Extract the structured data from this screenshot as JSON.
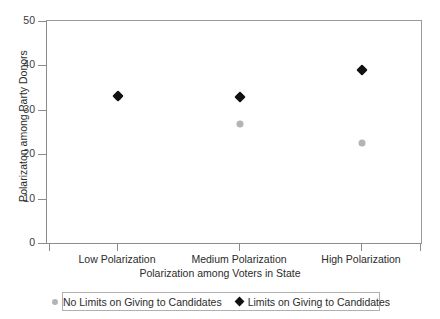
{
  "chart_data": {
    "type": "scatter",
    "title": "",
    "xlabel": "Polarization among Voters in State",
    "ylabel": "Polarizaton among Party Donors",
    "categories": [
      "Low Polarization",
      "Medium Polarization",
      "High Polarization"
    ],
    "ylim": [
      0,
      50
    ],
    "yticks": [
      0,
      10,
      20,
      30,
      40,
      50
    ],
    "ytick_labels": [
      "0",
      "10",
      "20",
      "30",
      "40",
      "50"
    ],
    "grid": false,
    "legend_position": "bottom",
    "series": [
      {
        "name": "No Limits on Giving to Candidates",
        "marker": "circle",
        "color": "#b4b4b4",
        "values": [
          33.2,
          27.0,
          22.7
        ]
      },
      {
        "name": "Limits on Giving to Candidates",
        "marker": "diamond",
        "color": "#111111",
        "values": [
          33.4,
          33.2,
          39.2
        ]
      }
    ]
  },
  "axis": {
    "y_title": "Polarizaton among Party Donors",
    "x_title": "Polarization among Voters in State",
    "y_tick_labels": [
      "50",
      "40",
      "30",
      "20",
      "10",
      "0"
    ],
    "x_tick_labels": [
      "Low Polarization",
      "Medium Polarization",
      "High Polarization"
    ]
  },
  "legend": {
    "entries": [
      {
        "label": "No Limits on Giving to Candidates",
        "marker": "circle",
        "color": "#b4b4b4"
      },
      {
        "label": "Limits on Giving to Candidates",
        "marker": "diamond",
        "color": "#111111"
      }
    ]
  },
  "colors": {
    "no_limits": "#b4b4b4",
    "limits": "#111111",
    "axis": "#8c8c8c",
    "text": "#2b2b2b",
    "background": "#ffffff"
  }
}
